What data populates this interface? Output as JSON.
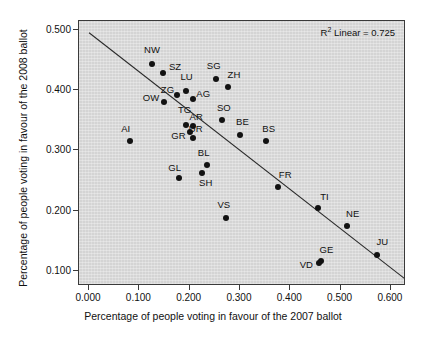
{
  "chart_data": {
    "type": "scatter",
    "title": "",
    "xlabel": "Percentage of people voting in favour of the 2007 ballot",
    "ylabel": "Percentage of people voting in favour of the 2008 ballot",
    "xlim": [
      -0.02,
      0.63
    ],
    "ylim": [
      0.075,
      0.515
    ],
    "xticks": [
      "0.000",
      "0.100",
      "0.200",
      "0.300",
      "0.400",
      "0.500",
      "0.600"
    ],
    "xtick_values": [
      0.0,
      0.1,
      0.2,
      0.3,
      0.4,
      0.5,
      0.6
    ],
    "yticks": [
      "0.100",
      "0.200",
      "0.300",
      "0.400",
      "0.500"
    ],
    "ytick_values": [
      0.1,
      0.2,
      0.3,
      0.4,
      0.5
    ],
    "grid": false,
    "legend": "none",
    "annotation": "R² Linear = 0.725",
    "annotation_text": "Linear = 0.725",
    "annotation_prefix": "R",
    "annotation_sup": "2",
    "r_squared": 0.725,
    "fit_line": {
      "type": "linear",
      "x_start": 0.0,
      "y_start": 0.4955,
      "x_end": 0.63,
      "y_end": 0.0855
    },
    "point_color": "#121212",
    "plot_background": "#d4d4d4",
    "labels": [
      "NW",
      "SZ",
      "SG",
      "ZH",
      "LU",
      "ZG",
      "AG",
      "OW",
      "TG",
      "AR",
      "UR",
      "GR",
      "AI",
      "SO",
      "BE",
      "BS",
      "BL",
      "SH",
      "GL",
      "VS",
      "FR",
      "TI",
      "NE",
      "JU",
      "GE",
      "VD"
    ],
    "points": [
      {
        "label": "NW",
        "x": 0.125,
        "y": 0.443,
        "lx": 0.125,
        "ly": 0.468
      },
      {
        "label": "SZ",
        "x": 0.146,
        "y": 0.429,
        "lx": 0.171,
        "ly": 0.44
      },
      {
        "label": "SG",
        "x": 0.253,
        "y": 0.418,
        "lx": 0.248,
        "ly": 0.442
      },
      {
        "label": "ZH",
        "x": 0.277,
        "y": 0.405,
        "lx": 0.288,
        "ly": 0.427
      },
      {
        "label": "LU",
        "x": 0.192,
        "y": 0.398,
        "lx": 0.194,
        "ly": 0.424
      },
      {
        "label": "ZG",
        "x": 0.175,
        "y": 0.392,
        "lx": 0.156,
        "ly": 0.402
      },
      {
        "label": "AG",
        "x": 0.206,
        "y": 0.385,
        "lx": 0.227,
        "ly": 0.395
      },
      {
        "label": "OW",
        "x": 0.148,
        "y": 0.38,
        "lx": 0.123,
        "ly": 0.388
      },
      {
        "label": "TG",
        "x": 0.193,
        "y": 0.342,
        "lx": 0.19,
        "ly": 0.369
      },
      {
        "label": "AR",
        "x": 0.206,
        "y": 0.34,
        "lx": 0.213,
        "ly": 0.357
      },
      {
        "label": "UR",
        "x": 0.2,
        "y": 0.331,
        "lx": 0.212,
        "ly": 0.338
      },
      {
        "label": "GR",
        "x": 0.206,
        "y": 0.32,
        "lx": 0.178,
        "ly": 0.325
      },
      {
        "label": "AI",
        "x": 0.082,
        "y": 0.315,
        "lx": 0.073,
        "ly": 0.337
      },
      {
        "label": "SO",
        "x": 0.265,
        "y": 0.35,
        "lx": 0.268,
        "ly": 0.373
      },
      {
        "label": "BE",
        "x": 0.3,
        "y": 0.325,
        "lx": 0.305,
        "ly": 0.349
      },
      {
        "label": "BS",
        "x": 0.351,
        "y": 0.315,
        "lx": 0.357,
        "ly": 0.338
      },
      {
        "label": "BL",
        "x": 0.235,
        "y": 0.276,
        "lx": 0.228,
        "ly": 0.298
      },
      {
        "label": "SH",
        "x": 0.224,
        "y": 0.263,
        "lx": 0.232,
        "ly": 0.247
      },
      {
        "label": "GL",
        "x": 0.178,
        "y": 0.255,
        "lx": 0.17,
        "ly": 0.272
      },
      {
        "label": "VS",
        "x": 0.272,
        "y": 0.188,
        "lx": 0.268,
        "ly": 0.211
      },
      {
        "label": "FR",
        "x": 0.376,
        "y": 0.24,
        "lx": 0.39,
        "ly": 0.261
      },
      {
        "label": "TI",
        "x": 0.456,
        "y": 0.205,
        "lx": 0.468,
        "ly": 0.225
      },
      {
        "label": "NE",
        "x": 0.513,
        "y": 0.175,
        "lx": 0.524,
        "ly": 0.196
      },
      {
        "label": "JU",
        "x": 0.573,
        "y": 0.127,
        "lx": 0.583,
        "ly": 0.149
      },
      {
        "label": "GE",
        "x": 0.461,
        "y": 0.117,
        "lx": 0.472,
        "ly": 0.136
      },
      {
        "label": "VD",
        "x": 0.458,
        "y": 0.113,
        "lx": 0.432,
        "ly": 0.112
      }
    ]
  }
}
